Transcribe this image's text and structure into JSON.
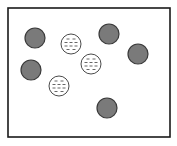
{
  "diagram": {
    "colors": {
      "frame_stroke": "#1a1a1a",
      "background": "#ffffff",
      "solid_fill": "#7a7a7a",
      "solid_stroke": "#3a3a3a",
      "dashed_fill": "#ffffff",
      "dashed_stroke": "#4a4a4a",
      "dash_color": "#555555"
    },
    "particles": [
      {
        "kind": "solid",
        "label": "dark-particle-1"
      },
      {
        "kind": "solid",
        "label": "dark-particle-2"
      },
      {
        "kind": "solid",
        "label": "dark-particle-3"
      },
      {
        "kind": "solid",
        "label": "dark-particle-4"
      },
      {
        "kind": "solid",
        "label": "dark-particle-5"
      },
      {
        "kind": "dashed",
        "label": "dashed-particle-1"
      },
      {
        "kind": "dashed",
        "label": "dashed-particle-2"
      },
      {
        "kind": "dashed",
        "label": "dashed-particle-3"
      }
    ],
    "counts": {
      "solid": 5,
      "dashed": 3
    }
  }
}
